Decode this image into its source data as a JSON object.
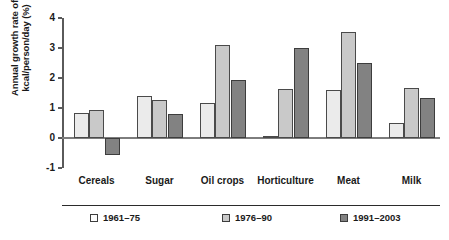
{
  "chart_data": {
    "type": "bar",
    "title": "",
    "xlabel": "",
    "ylabel": "Annual growth rate of kcal/person/day (%)",
    "ylim": [
      -1,
      4
    ],
    "yticks": [
      -1,
      0,
      1,
      2,
      3,
      4
    ],
    "ytick_labels": [
      "-1",
      "0",
      "1",
      "2",
      "3",
      "4"
    ],
    "grid": false,
    "legend_position": "bottom",
    "categories": [
      "Cereals",
      "Sugar",
      "Oil crops",
      "Horticulture",
      "Meat",
      "Milk"
    ],
    "series": [
      {
        "name": "1961–75",
        "color": "#ebebeb",
        "values": [
          0.85,
          1.4,
          1.18,
          0.08,
          1.6,
          0.5
        ]
      },
      {
        "name": "1976–90",
        "color": "#c9c9c9",
        "values": [
          0.95,
          1.27,
          3.1,
          1.65,
          3.55,
          1.67
        ]
      },
      {
        "name": "1991–2003",
        "color": "#828282",
        "values": [
          -0.55,
          0.8,
          1.95,
          3.0,
          2.5,
          1.35
        ]
      }
    ]
  },
  "legend": {
    "items": [
      {
        "label": "1961–75"
      },
      {
        "label": "1976–90"
      },
      {
        "label": "1991–2003"
      }
    ]
  }
}
